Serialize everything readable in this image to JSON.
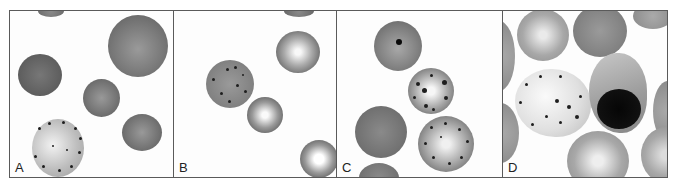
{
  "figure": {
    "panels": [
      {
        "id": "A",
        "label": "A"
      },
      {
        "id": "B",
        "label": "B"
      },
      {
        "id": "C",
        "label": "C"
      },
      {
        "id": "D",
        "label": "D"
      }
    ]
  },
  "colors": {
    "border": "#5a5a5a",
    "cell_gray": "#7a7a7a",
    "cell_dark": "#5e5e5e",
    "inclusion": "#1e1e1e",
    "background": "#fdfdfd"
  }
}
